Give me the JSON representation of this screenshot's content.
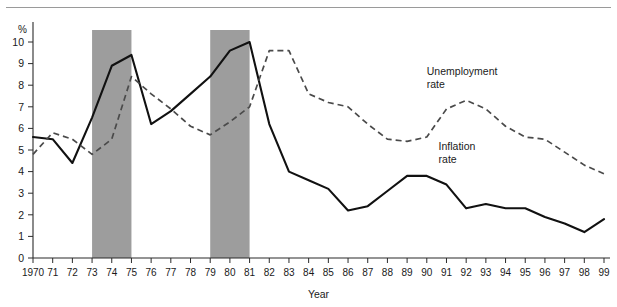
{
  "chart_data": {
    "type": "line",
    "title": "",
    "xlabel": "Year",
    "ylabel": "%",
    "ylim": [
      0,
      10.8
    ],
    "xlim": [
      1970,
      1999
    ],
    "grid": false,
    "legend_position": "inline-annotations",
    "yticks": [
      "0",
      "1",
      "2",
      "3",
      "4",
      "5",
      "6",
      "7",
      "8",
      "9",
      "10"
    ],
    "ytick_values": [
      0,
      1,
      2,
      3,
      4,
      5,
      6,
      7,
      8,
      9,
      10
    ],
    "categories": [
      1970,
      1971,
      1972,
      1973,
      1974,
      1975,
      1976,
      1977,
      1978,
      1979,
      1980,
      1981,
      1982,
      1983,
      1984,
      1985,
      1986,
      1987,
      1988,
      1989,
      1990,
      1991,
      1992,
      1993,
      1994,
      1995,
      1996,
      1997,
      1998,
      1999
    ],
    "xtick_labels": [
      "1970",
      "71",
      "72",
      "73",
      "74",
      "75",
      "76",
      "77",
      "78",
      "79",
      "80",
      "81",
      "82",
      "83",
      "84",
      "85",
      "86",
      "87",
      "88",
      "89",
      "90",
      "91",
      "92",
      "93",
      "94",
      "95",
      "96",
      "97",
      "98",
      "99"
    ],
    "series": [
      {
        "name": "Inflation rate",
        "style": "solid",
        "color": "#111111",
        "values": [
          5.6,
          5.5,
          4.4,
          6.5,
          8.9,
          9.4,
          6.2,
          6.8,
          7.6,
          8.4,
          9.6,
          10.0,
          6.2,
          4.0,
          3.6,
          3.2,
          2.2,
          2.4,
          3.1,
          3.8,
          3.8,
          3.4,
          2.3,
          2.5,
          2.3,
          2.3,
          1.9,
          1.6,
          1.2,
          1.8
        ]
      },
      {
        "name": "Unemployment rate",
        "style": "dashed",
        "color": "#4a4a4a",
        "values": [
          4.8,
          5.8,
          5.5,
          4.8,
          5.5,
          8.4,
          7.6,
          6.9,
          6.1,
          5.7,
          6.3,
          7.0,
          9.6,
          9.6,
          7.6,
          7.2,
          7.0,
          6.2,
          5.5,
          5.4,
          5.6,
          6.9,
          7.3,
          6.9,
          6.1,
          5.6,
          5.5,
          4.9,
          4.3,
          3.9
        ]
      }
    ],
    "shaded_bands": [
      {
        "label": "recession-1973-1975",
        "start": 1973,
        "end": 1975
      },
      {
        "label": "recession-1979-1981",
        "start": 1979,
        "end": 1981
      }
    ],
    "band_color": "#9d9d9d",
    "annotations": [
      {
        "name": "unemployment-label",
        "lines": [
          "Unemployment",
          "rate"
        ],
        "x": 1990.0,
        "y": 8.45
      },
      {
        "name": "inflation-label",
        "lines": [
          "Inflation",
          "rate"
        ],
        "x": 1990.6,
        "y": 5.0
      }
    ]
  }
}
